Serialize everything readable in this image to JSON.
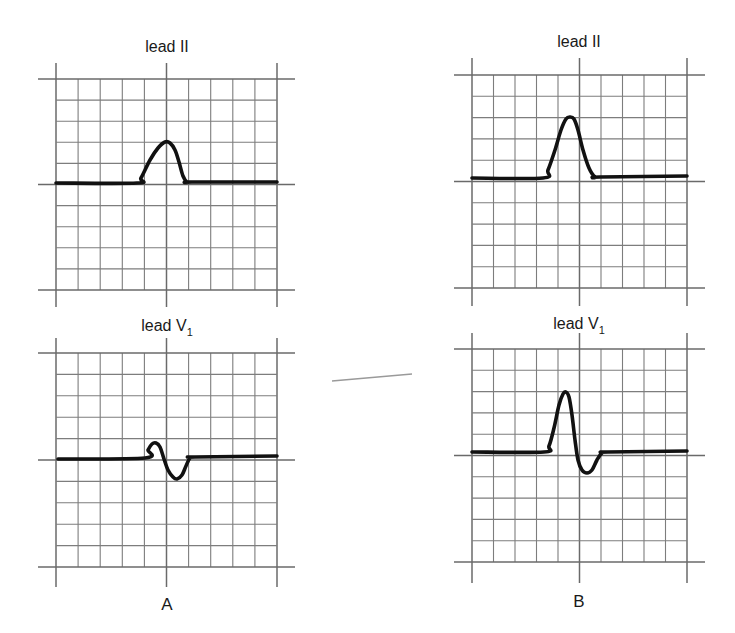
{
  "figure": {
    "colors": {
      "background": "#ffffff",
      "grid": "#777777",
      "trace": "#111111",
      "text": "#1a1a1a"
    }
  },
  "panels": [
    {
      "id": "A",
      "label": "A",
      "label_pos": [
        167,
        610
      ],
      "leads": [
        {
          "name": "lead II",
          "sub": "",
          "title_pos": [
            167,
            52
          ],
          "grid": {
            "x0": 56,
            "x1": 277,
            "y0": 79,
            "y1": 290,
            "cols": 10,
            "rows": 10,
            "ext": 18,
            "vtop": 63,
            "vbot": 307
          },
          "baseline_row": 5,
          "trace": [
            [
              56,
              183
            ],
            [
              137,
              183
            ],
            [
              141,
              178
            ],
            [
              150,
              160
            ],
            [
              158,
              148
            ],
            [
              165,
              142
            ],
            [
              170,
              143
            ],
            [
              175,
              150
            ],
            [
              179,
              162
            ],
            [
              183,
              176
            ],
            [
              187,
              182
            ],
            [
              192,
              182
            ],
            [
              277,
              182
            ]
          ]
        },
        {
          "name": "lead V",
          "sub": "1",
          "title_pos": [
            167,
            331
          ],
          "grid": {
            "x0": 56,
            "x1": 277,
            "y0": 353,
            "y1": 567,
            "cols": 10,
            "rows": 10,
            "ext": 18,
            "vtop": 338,
            "vbot": 587
          },
          "baseline_row": 5,
          "trace": [
            [
              58,
              459
            ],
            [
              145,
              458
            ],
            [
              148,
              450
            ],
            [
              152,
              444
            ],
            [
              156,
              443
            ],
            [
              160,
              447
            ],
            [
              164,
              459
            ],
            [
              168,
              470
            ],
            [
              173,
              477
            ],
            [
              177,
              479
            ],
            [
              182,
              475
            ],
            [
              186,
              466
            ],
            [
              190,
              458
            ],
            [
              195,
              457
            ],
            [
              277,
              456
            ]
          ]
        }
      ]
    },
    {
      "id": "B",
      "label": "B",
      "label_pos": [
        579,
        607
      ],
      "leads": [
        {
          "name": "lead II",
          "sub": "",
          "title_pos": [
            579,
            47
          ],
          "grid": {
            "x0": 472,
            "x1": 687,
            "y0": 75,
            "y1": 288,
            "cols": 10,
            "rows": 10,
            "ext": 18,
            "vtop": 58,
            "vbot": 306
          },
          "baseline_row": 5,
          "trace": [
            [
              472,
              178
            ],
            [
              543,
              178
            ],
            [
              548,
              170
            ],
            [
              555,
              150
            ],
            [
              561,
              130
            ],
            [
              566,
              119
            ],
            [
              570,
              117
            ],
            [
              574,
              119
            ],
            [
              578,
              130
            ],
            [
              583,
              150
            ],
            [
              589,
              168
            ],
            [
              595,
              177
            ],
            [
              600,
              177
            ],
            [
              687,
              176
            ]
          ]
        },
        {
          "name": "lead V",
          "sub": "1",
          "title_pos": [
            579,
            329
          ],
          "grid": {
            "x0": 472,
            "x1": 687,
            "y0": 349,
            "y1": 562,
            "cols": 10,
            "rows": 10,
            "ext": 18,
            "vtop": 333,
            "vbot": 583
          },
          "baseline_row": 5,
          "trace": [
            [
              472,
              452
            ],
            [
              544,
              452
            ],
            [
              549,
              446
            ],
            [
              554,
              428
            ],
            [
              559,
              405
            ],
            [
              563,
              394
            ],
            [
              566,
              392
            ],
            [
              569,
              397
            ],
            [
              572,
              415
            ],
            [
              575,
              440
            ],
            [
              578,
              460
            ],
            [
              582,
              470
            ],
            [
              587,
              473
            ],
            [
              592,
              470
            ],
            [
              597,
              460
            ],
            [
              602,
              453
            ],
            [
              608,
              452
            ],
            [
              687,
              451
            ]
          ]
        }
      ]
    }
  ],
  "annotations": {
    "stray_mark": [
      [
        332,
        381
      ],
      [
        412,
        374
      ]
    ]
  }
}
